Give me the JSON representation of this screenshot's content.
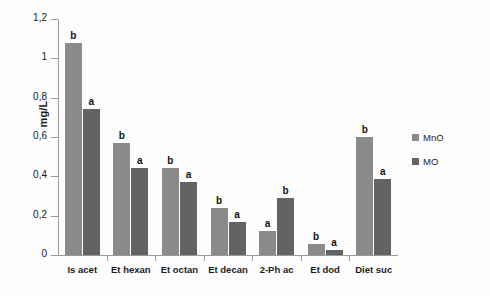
{
  "chart_data": {
    "type": "bar",
    "title": "",
    "xlabel": "",
    "ylabel": "mg/L",
    "ylim": [
      0,
      1.2
    ],
    "ytick_labels": [
      "0",
      "0,2",
      "0,4",
      "0,6",
      "0,8",
      "1",
      "1,2"
    ],
    "ytick_values": [
      0,
      0.2,
      0.4,
      0.6,
      0.8,
      1.0,
      1.2
    ],
    "grid": false,
    "legend_position": "right",
    "categories": [
      "Is acet",
      "Et hexan",
      "Et octan",
      "Et decan",
      "2-Ph ac",
      "Et dod",
      "Diet suc"
    ],
    "series": [
      {
        "name": "MnO",
        "color": "#8a8a8a",
        "values": [
          1.08,
          0.57,
          0.44,
          0.24,
          0.12,
          0.055,
          0.6
        ],
        "annotations": [
          "b",
          "b",
          "b",
          "b",
          "a",
          "b",
          "b"
        ]
      },
      {
        "name": "MO",
        "color": "#636363",
        "values": [
          0.74,
          0.44,
          0.37,
          0.17,
          0.29,
          0.025,
          0.385
        ],
        "annotations": [
          "a",
          "a",
          "a",
          "a",
          "b",
          "a",
          "a"
        ]
      }
    ]
  }
}
